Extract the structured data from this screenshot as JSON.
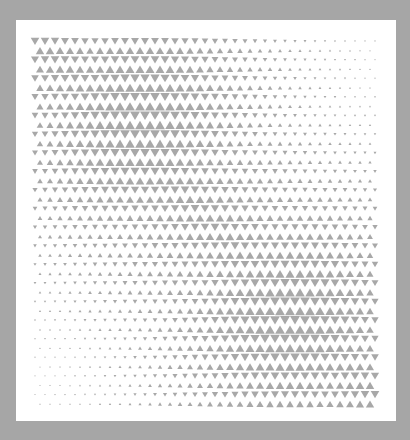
{
  "artwork": {
    "title": "",
    "description": "Halftone triangle pattern",
    "colors": {
      "background": "#a6a6a6",
      "panel": "#ffffff",
      "triangle": "#a8a8a8"
    },
    "pattern": {
      "columns": 35,
      "rows": 40,
      "orientation_sequence": [
        "down",
        "up"
      ],
      "density_peaks": [
        {
          "name": "upper-left-cluster",
          "u": 0.3,
          "v": 0.22,
          "strength": 1.0
        },
        {
          "name": "lower-right-cluster",
          "u": 0.73,
          "v": 0.76,
          "strength": 1.0
        }
      ],
      "density_troughs": [
        {
          "name": "upper-right-sparse",
          "u": 1.0,
          "v": 0.0
        },
        {
          "name": "lower-left-sparse",
          "u": 0.0,
          "v": 1.0
        }
      ],
      "min_scale": 0.12,
      "max_scale": 0.98
    }
  }
}
